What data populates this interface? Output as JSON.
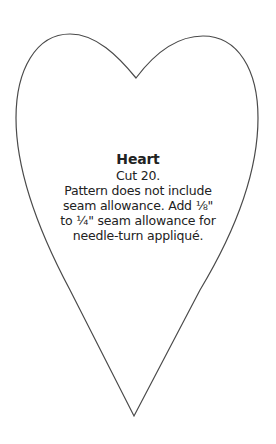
{
  "pattern": {
    "name": "Heart",
    "cut": "Cut 20.",
    "instructions": [
      "Pattern does not include",
      "seam allowance. Add ⅛\"",
      "to ¼\" seam allowance for",
      "needle-turn appliqué."
    ]
  },
  "colors": {
    "outline": "#4a4a4a",
    "background": "#ffffff",
    "text": "#222222"
  }
}
